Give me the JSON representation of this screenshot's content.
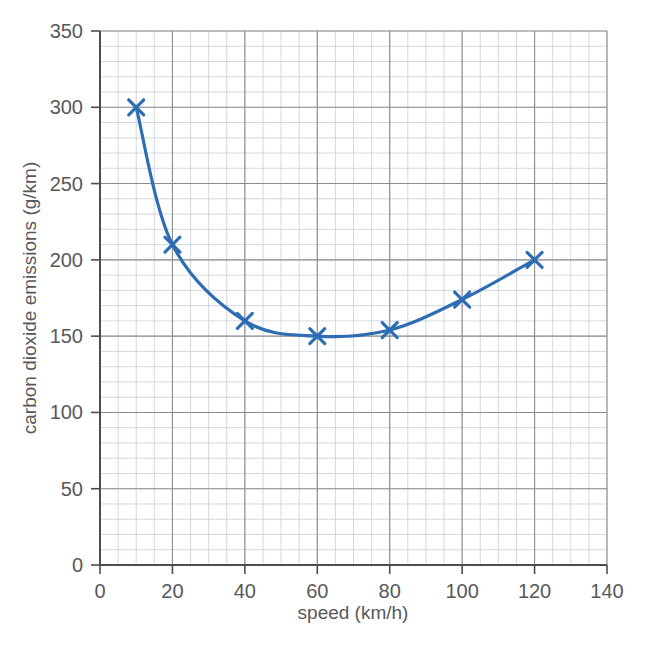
{
  "chart_data": {
    "type": "line",
    "title": "",
    "xlabel": "speed (km/h)",
    "ylabel": "carbon dioxide emissions (g/km)",
    "x": [
      10,
      20,
      40,
      60,
      80,
      100,
      120
    ],
    "values": [
      300,
      210,
      160,
      150,
      154,
      174,
      200
    ],
    "series": [
      {
        "name": "carbon dioxide emissions",
        "x": [
          10,
          20,
          40,
          60,
          80,
          100,
          120
        ],
        "values": [
          300,
          210,
          160,
          150,
          154,
          174,
          200
        ]
      }
    ],
    "xlim": [
      0,
      140
    ],
    "ylim": [
      0,
      350
    ],
    "xticks": [
      0,
      20,
      40,
      60,
      80,
      100,
      120,
      140
    ],
    "yticks": [
      0,
      50,
      100,
      150,
      200,
      250,
      300,
      350
    ],
    "x_minor_step": 5,
    "y_minor_step": 10,
    "grid": true,
    "grid_minor": true,
    "legend": "none",
    "marker": "x",
    "line_color": "#2e6db4",
    "marker_color": "#2e6db4",
    "grid_major_color": "#8c8c8c",
    "grid_minor_color": "#c8cfd8",
    "axis_color": "#4d4d4d",
    "text_color": "#58585a",
    "background": "#ffffff"
  },
  "axes": {
    "x_tick_labels": [
      "0",
      "20",
      "40",
      "60",
      "80",
      "100",
      "120",
      "140"
    ],
    "y_tick_labels": [
      "0",
      "50",
      "100",
      "150",
      "200",
      "250",
      "300",
      "350"
    ],
    "x_axis_title": "speed (km/h)",
    "y_axis_title": "carbon dioxide emissions (g/km)"
  }
}
